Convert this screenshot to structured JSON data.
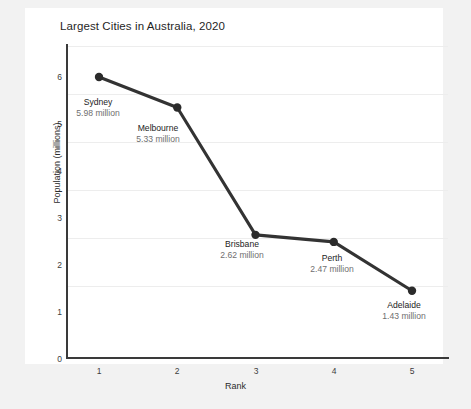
{
  "chart_data": {
    "type": "line",
    "title": "Largest Cities in Australia, 2020",
    "xlabel": "Rank",
    "ylabel": "Population (millions)",
    "x": [
      1,
      2,
      3,
      4,
      5
    ],
    "categories": [
      "Sydney",
      "Melbourne",
      "Brisbane",
      "Perth",
      "Adelaide"
    ],
    "values": [
      5.98,
      5.33,
      2.62,
      2.47,
      1.43
    ],
    "point_labels": [
      {
        "name": "Sydney",
        "value": "5.98 million"
      },
      {
        "name": "Melbourne",
        "value": "5.33 million"
      },
      {
        "name": "Brisbane",
        "value": "2.62 million"
      },
      {
        "name": "Perth",
        "value": "2.47 million"
      },
      {
        "name": "Adelaide",
        "value": "1.43 million"
      }
    ],
    "xlim": [
      0.55,
      5.45
    ],
    "ylim": [
      0,
      6.5
    ],
    "xticks": [
      "1",
      "2",
      "3",
      "4",
      "5"
    ],
    "yticks": [
      "0",
      "1",
      "2",
      "3",
      "4",
      "5",
      "6"
    ],
    "grid": "horizontal",
    "legend": "none",
    "series_color": "#333333",
    "marker_color": "#2b2b2b",
    "grid_color": "#ededed",
    "axis_color": "#3a3a3a",
    "panel_color": "#ffffff",
    "background_color": "#f2f2f2"
  }
}
